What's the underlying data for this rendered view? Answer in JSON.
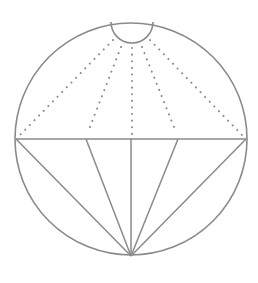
{
  "diagram": {
    "stroke_color": "#8a8a8a",
    "dot_color": "#8a8a8a",
    "circle": {
      "cx": 131,
      "cy": 139,
      "r": 116
    },
    "small_arc": {
      "x1": 111,
      "y1": 22,
      "x2": 153,
      "y2": 22,
      "r": 21
    },
    "chord": {
      "x1": 16,
      "y1": 139,
      "x2": 246,
      "y2": 139
    },
    "apex": {
      "x": 131,
      "y": 256
    },
    "solid_lines": [
      {
        "x1": 16,
        "y1": 139
      },
      {
        "x1": 86,
        "y1": 139
      },
      {
        "x1": 131,
        "y1": 139
      },
      {
        "x1": 178,
        "y1": 139
      },
      {
        "x1": 246,
        "y1": 139
      }
    ],
    "dotted_lines": [
      {
        "x1": 113,
        "y1": 40,
        "x2": 20,
        "y2": 135
      },
      {
        "x1": 121,
        "y1": 47,
        "x2": 88,
        "y2": 132
      },
      {
        "x1": 132,
        "y1": 48,
        "x2": 132,
        "y2": 134
      },
      {
        "x1": 142,
        "y1": 47,
        "x2": 176,
        "y2": 132
      },
      {
        "x1": 150,
        "y1": 40,
        "x2": 242,
        "y2": 135
      }
    ]
  }
}
